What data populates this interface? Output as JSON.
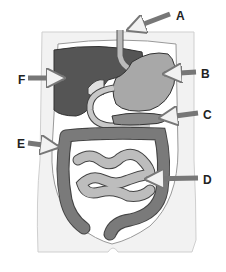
{
  "diagram": {
    "title": "",
    "labels": [
      {
        "id": "A",
        "text": "A",
        "x": 176,
        "y": 10,
        "points_to": "esophagus"
      },
      {
        "id": "B",
        "text": "B",
        "x": 201,
        "y": 68,
        "points_to": "stomach"
      },
      {
        "id": "C",
        "text": "C",
        "x": 203,
        "y": 109,
        "points_to": "pancreas"
      },
      {
        "id": "D",
        "text": "D",
        "x": 203,
        "y": 174,
        "points_to": "small intestine"
      },
      {
        "id": "E",
        "text": "E",
        "x": 17,
        "y": 138,
        "points_to": "large intestine"
      },
      {
        "id": "F",
        "text": "F",
        "x": 18,
        "y": 74,
        "points_to": "liver"
      }
    ],
    "colors": {
      "body_outline": "#e8e8e8",
      "liver": "#555555",
      "stomach": "#a8a8a8",
      "small_intestine": "#b5b5b5",
      "large_intestine": "#7a7a7a",
      "arrow": "#888888",
      "label_text": "#222222"
    }
  }
}
